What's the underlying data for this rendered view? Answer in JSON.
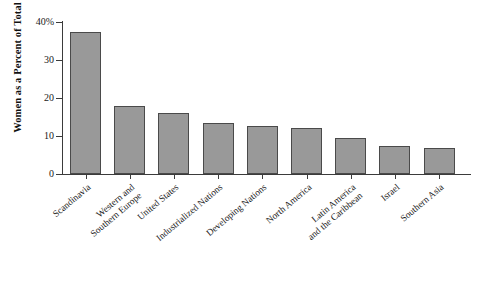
{
  "chart_data": {
    "type": "bar",
    "title": "",
    "xlabel": "",
    "ylabel": "Women as a Percent of Total",
    "ylim": [
      0,
      40
    ],
    "yticks": [
      0,
      10,
      20,
      30,
      40
    ],
    "ytick_labels": [
      "0",
      "10",
      "20",
      "30",
      "40%"
    ],
    "grid": false,
    "legend": "none",
    "bar_color": "#999999",
    "bar_edge_color": "#4a4a4a",
    "axis_color": "#3b3b3b",
    "categories": [
      "Scandinavia",
      "Western and\nSouthern Europe",
      "United States",
      "Industrialized Nations",
      "Developing Nations",
      "North America",
      "Latin America\nand the Caribbean",
      "Israel",
      "Southern Asia"
    ],
    "values": [
      37.5,
      18.0,
      16.0,
      13.5,
      12.6,
      12.0,
      9.5,
      7.5,
      6.8
    ]
  }
}
